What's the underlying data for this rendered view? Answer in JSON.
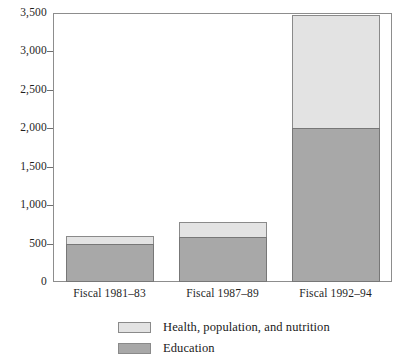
{
  "chart_data": {
    "type": "bar",
    "subtype": "stacked",
    "title": "",
    "xlabel": "",
    "ylabel": "",
    "categories": [
      "Fiscal 1981–83",
      "Fiscal 1987–89",
      "Fiscal 1992–94"
    ],
    "series": [
      {
        "name": "Education",
        "color": "#a8a8a8",
        "values": [
          500,
          580,
          2000
        ]
      },
      {
        "name": "Health, population, and nutrition",
        "color": "#e3e3e3",
        "values": [
          100,
          200,
          1480
        ]
      }
    ],
    "totals": [
      600,
      780,
      3480
    ],
    "ylim": [
      0,
      3500
    ],
    "yticks": [
      0,
      500,
      1000,
      1500,
      2000,
      2500,
      3000,
      3500
    ],
    "ytick_labels": [
      "0",
      "500",
      "1,000",
      "1,500",
      "2,000",
      "2,500",
      "3,000",
      "3,500"
    ],
    "grid": false,
    "legend_position": "bottom"
  },
  "legend": {
    "items": [
      {
        "label": "Health, population, and nutrition",
        "color": "#e3e3e3"
      },
      {
        "label": "Education",
        "color": "#a8a8a8"
      }
    ]
  },
  "colors": {
    "health": "#e3e3e3",
    "education": "#a8a8a8",
    "frame": "#8d8d8d",
    "text": "#1a1a1a"
  }
}
